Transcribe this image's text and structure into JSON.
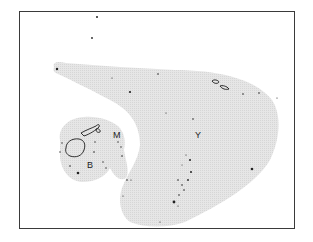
{
  "map": {
    "frame": {
      "x": 19,
      "y": 11,
      "width": 276,
      "height": 218,
      "border_color": "#3a3a3a"
    },
    "colors": {
      "shaded_region": "#e4e4e4",
      "island_outline": "#1a1a1a",
      "dot": "#222222",
      "background": "#ffffff"
    },
    "regions": [
      {
        "id": "B",
        "label": "B",
        "label_pos": [
          90,
          168
        ]
      },
      {
        "id": "M",
        "label": "M",
        "label_pos": [
          116,
          138
        ]
      },
      {
        "id": "Y",
        "label": "Y",
        "label_pos": [
          196,
          138
        ]
      }
    ]
  }
}
